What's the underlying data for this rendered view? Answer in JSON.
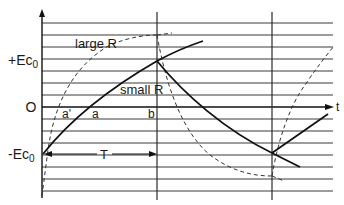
{
  "diagram": {
    "labels": {
      "plus_ec0": "+Ec",
      "plus_ec0_sub": "0",
      "zero": "O",
      "minus_ec0": "-Ec",
      "minus_ec0_sub": "0",
      "large_r": "large R",
      "small_r": "small R",
      "a_prime": "a'",
      "a": "a",
      "b": "b",
      "period": "T",
      "time_axis": "t"
    },
    "grid": {
      "horizontal_lines_y": [
        23,
        35,
        47,
        59,
        71,
        83,
        95,
        119,
        131,
        143,
        155,
        167,
        179,
        191
      ],
      "x_start": 42,
      "x_end": 333
    },
    "axes": {
      "zero_y": 107,
      "y_axis_x": 42,
      "vertical_markers_x": [
        157,
        272
      ]
    },
    "colors": {
      "ink": "#111111",
      "grid": "#3a3a3a",
      "background": "#ffffff"
    }
  }
}
